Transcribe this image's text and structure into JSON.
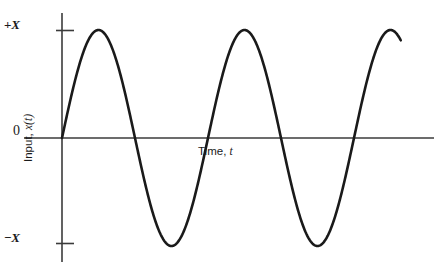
{
  "figure": {
    "background_color": "#ffffff",
    "curve_color": "#1a1a1a",
    "axis_color": "#3b3b3b"
  },
  "axes": {
    "y_axis_label_prefix": "Input, ",
    "y_axis_label_variable": "x(t)",
    "x_axis_label_prefix": "Time, ",
    "x_axis_label_variable": "t",
    "y_ticks": [
      {
        "sign": "+",
        "symbol": "X"
      },
      {
        "sign": "−",
        "symbol": "X"
      }
    ],
    "origin_label": "0"
  },
  "chart_data": {
    "type": "line",
    "title": "",
    "xlabel": "Time, t",
    "ylabel": "Input, x(t)",
    "legend": [],
    "grid": false,
    "xlim": [
      0,
      2.57
    ],
    "ylim": [
      -1.18,
      1.18
    ],
    "y_tick_values": [
      1,
      0,
      -1
    ],
    "y_tick_labels": [
      "+X",
      "0",
      "−X"
    ],
    "x_tick_values": [],
    "x_tick_labels": [],
    "annotations": [],
    "series": [
      {
        "name": "x(t) = X sin(2πt/T)",
        "waveform": "sine",
        "amplitude": 1,
        "period": 1,
        "phase": 0,
        "x_start": 0,
        "x_end": 2.32,
        "x": [
          0,
          0.05,
          0.1,
          0.15,
          0.2,
          0.25,
          0.3,
          0.35,
          0.4,
          0.45,
          0.5,
          0.55,
          0.6,
          0.65,
          0.7,
          0.75,
          0.8,
          0.85,
          0.9,
          0.95,
          1,
          1.05,
          1.1,
          1.15,
          1.2,
          1.25,
          1.3,
          1.35,
          1.4,
          1.45,
          1.5,
          1.55,
          1.6,
          1.65,
          1.7,
          1.75,
          1.8,
          1.85,
          1.9,
          1.95,
          2,
          2.05,
          2.1,
          2.15,
          2.2,
          2.25,
          2.3,
          2.32
        ],
        "y": [
          0,
          0.309,
          0.588,
          0.809,
          0.951,
          1,
          0.951,
          0.809,
          0.588,
          0.309,
          0,
          -0.309,
          -0.588,
          -0.809,
          -0.951,
          -1,
          -0.951,
          -0.809,
          -0.588,
          -0.309,
          0,
          0.309,
          0.588,
          0.809,
          0.951,
          1,
          0.951,
          0.809,
          0.588,
          0.309,
          0,
          -0.309,
          -0.588,
          -0.809,
          -0.951,
          -1,
          -0.951,
          -0.809,
          -0.588,
          -0.309,
          0,
          0.309,
          0.588,
          0.809,
          0.951,
          1,
          0.951,
          0.927
        ]
      }
    ],
    "zero_crossings": [
      0,
      0.5,
      1.0,
      1.5,
      2.0
    ],
    "peaks": [
      0.25,
      1.25,
      2.25
    ],
    "troughs": [
      0.75,
      1.75
    ]
  }
}
